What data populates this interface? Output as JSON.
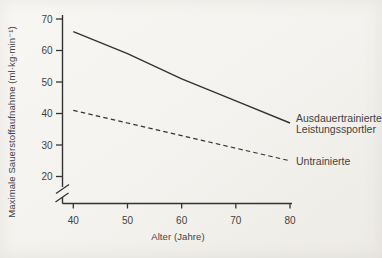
{
  "figure": {
    "background": "#f4f2ee",
    "ink": "#333333",
    "text_color": "#424242"
  },
  "chart_data": {
    "type": "line",
    "title": "",
    "xlabel": "Alter (Jahre)",
    "ylabel": "Maximale Sauerstoffaufnahme (ml·kg·min⁻¹)",
    "x": [
      40,
      50,
      60,
      70,
      80
    ],
    "xticks": [
      40,
      50,
      60,
      70,
      80
    ],
    "yticks": [
      70,
      60,
      50,
      40,
      30,
      20
    ],
    "xlim": [
      40,
      80
    ],
    "ylim": [
      20,
      70
    ],
    "y_axis_break_below": 20,
    "grid": false,
    "legend_position": "labels at right ends of lines",
    "series": [
      {
        "id": "trained",
        "name": "Ausdauertrainierte Leistungssportler",
        "label_lines": [
          "Ausdauertrainierte",
          "Leistungssportler"
        ],
        "style": "solid",
        "values": [
          66,
          59,
          51,
          44,
          37
        ]
      },
      {
        "id": "untrained",
        "name": "Untrainierte",
        "label_lines": [
          "Untrainierte"
        ],
        "style": "dashed",
        "values": [
          41,
          37,
          33,
          29,
          25
        ]
      }
    ]
  }
}
